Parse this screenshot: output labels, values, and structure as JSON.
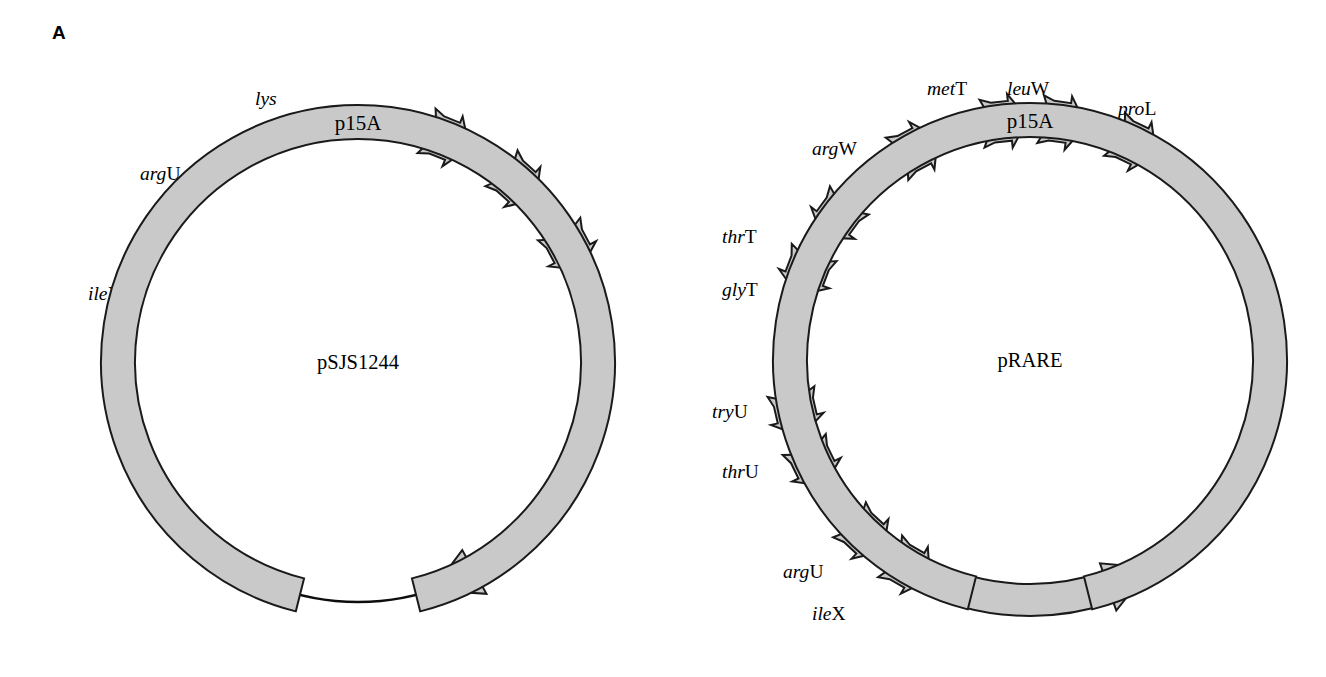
{
  "figure": {
    "panel_label": "A",
    "background_color": "#ffffff",
    "feature_fill_color": "#c9c9c9",
    "outline_color": "#1a1a1a"
  },
  "chart_data": {
    "type": "diagram",
    "title": "A",
    "subtype": "circular plasmid maps",
    "plasmids": [
      {
        "name": "pSJS1244",
        "center": [
          358,
          362
        ],
        "radius": 240,
        "features": [
          {
            "id": "psjs-lys",
            "label": "lys",
            "label_italic": "lys",
            "label_upright": "",
            "type": "trna-arrow",
            "angle_deg": 68,
            "direction": "clockwise",
            "label_x": 255,
            "label_y": 105
          },
          {
            "id": "psjs-argu",
            "label": "argU",
            "label_italic": "arg",
            "label_upright": "U",
            "type": "trna-arrow",
            "angle_deg": 48,
            "direction": "clockwise",
            "label_x": 140,
            "label_y": 180
          },
          {
            "id": "psjs-ilex",
            "label": "ileX",
            "label_italic": "ile",
            "label_upright": "X",
            "type": "trna-arrow",
            "angle_deg": 28,
            "direction": "clockwise",
            "label_x": 88,
            "label_y": 300
          },
          {
            "id": "psjs-spec",
            "label": "Spectinomycin",
            "type": "arc-arrow",
            "start_deg": 352,
            "end_deg": 288,
            "direction": "clockwise",
            "text_rotation": 90
          },
          {
            "id": "psjs-p15a",
            "label": "p15A",
            "type": "arc-band",
            "start_deg": 256,
            "end_deg": 284,
            "direction": "none"
          }
        ]
      },
      {
        "name": "pRARE",
        "center": [
          1030,
          360
        ],
        "radius": 240,
        "features": [
          {
            "id": "prare-argw",
            "label": "argW",
            "label_italic": "arg",
            "label_upright": "W",
            "type": "trna-arrow",
            "angle_deg": 118,
            "direction": "clockwise",
            "label_x": 812,
            "label_y": 155
          },
          {
            "id": "prare-mett",
            "label": "metT",
            "label_italic": "met",
            "label_upright": "T",
            "type": "trna-arrow",
            "angle_deg": 96,
            "direction": "clockwise",
            "label_x": 927,
            "label_y": 95
          },
          {
            "id": "prare-leuw",
            "label": "leuW",
            "label_italic": "leu",
            "label_upright": "W",
            "type": "trna-arrow",
            "angle_deg": 82,
            "direction": "clockwise",
            "label_x": 1007,
            "label_y": 95
          },
          {
            "id": "prare-prol",
            "label": "proL",
            "label_italic": "pro",
            "label_upright": "L",
            "type": "trna-arrow",
            "angle_deg": 64,
            "direction": "clockwise",
            "label_x": 1118,
            "label_y": 115
          },
          {
            "id": "prare-thrt",
            "label": "thrT",
            "label_italic": "thr",
            "label_upright": "T",
            "type": "trna-arrow",
            "angle_deg": 144,
            "direction": "counterclockwise",
            "label_x": 722,
            "label_y": 243
          },
          {
            "id": "prare-glyt",
            "label": "glyT",
            "label_italic": "gly",
            "label_upright": "T",
            "type": "trna-arrow",
            "angle_deg": 159,
            "direction": "counterclockwise",
            "label_x": 722,
            "label_y": 296
          },
          {
            "id": "prare-tryu",
            "label": "tryU",
            "label_italic": "try",
            "label_upright": "U",
            "type": "trna-arrow",
            "angle_deg": 193,
            "direction": "counterclockwise",
            "label_x": 712,
            "label_y": 418
          },
          {
            "id": "prare-thru",
            "label": "thrU",
            "label_italic": "thr",
            "label_upright": "U",
            "type": "trna-arrow",
            "angle_deg": 206,
            "direction": "counterclockwise",
            "label_x": 722,
            "label_y": 478
          },
          {
            "id": "prare-argu",
            "label": "argU",
            "label_italic": "arg",
            "label_upright": "U",
            "type": "trna-arrow",
            "angle_deg": 227,
            "direction": "counterclockwise",
            "label_x": 783,
            "label_y": 578
          },
          {
            "id": "prare-ilex",
            "label": "ileX",
            "label_italic": "ile",
            "label_upright": "X",
            "type": "trna-arrow",
            "angle_deg": 240,
            "direction": "counterclockwise",
            "label_x": 812,
            "label_y": 620
          },
          {
            "id": "prare-cam",
            "label": "Chloramphenicol",
            "type": "arc-arrow",
            "start_deg": 300,
            "end_deg": 10,
            "direction": "counterclockwise",
            "text_rotation": 90
          },
          {
            "id": "prare-p15a",
            "label": "p15A",
            "type": "arc-band",
            "start_deg": 256,
            "end_deg": 284,
            "direction": "none"
          }
        ]
      }
    ]
  }
}
